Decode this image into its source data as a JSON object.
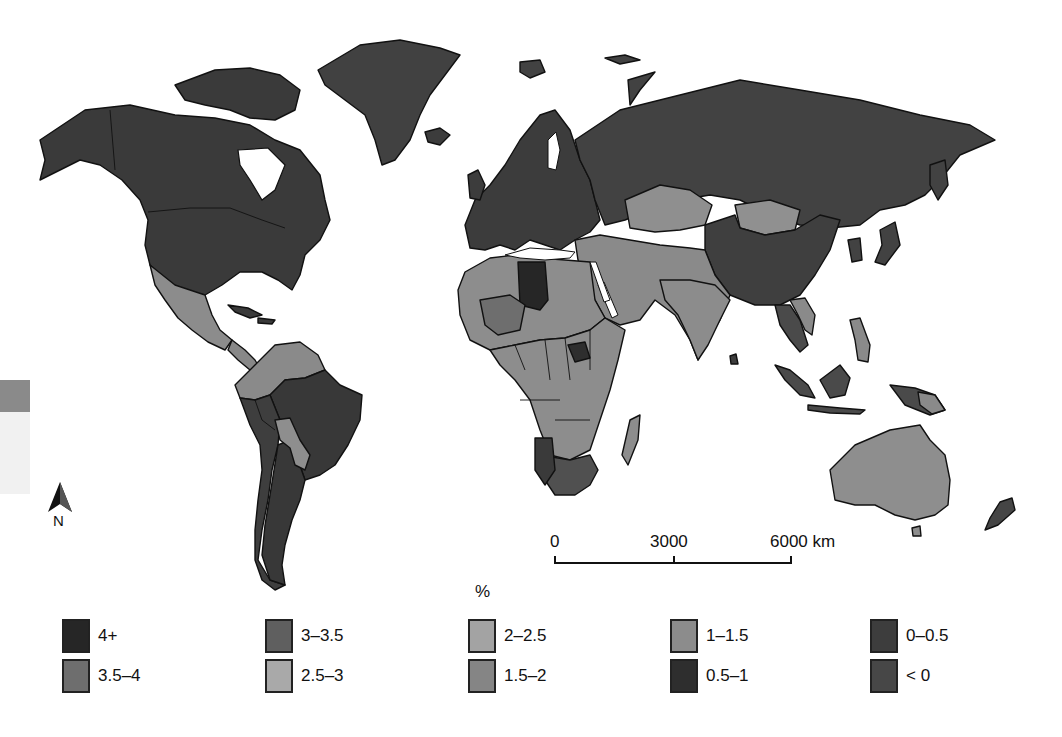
{
  "map": {
    "type": "choropleth",
    "subject": "world countries shaded by percentage class",
    "background": "#ffffff",
    "border_color": "#111111",
    "north_arrow": {
      "label": "N"
    },
    "scale_bar": {
      "ticks": [
        "0",
        "3000",
        "6000 km"
      ],
      "max_km": 6000
    },
    "legend": {
      "title": "%",
      "classes": [
        {
          "label": "4+",
          "color": "#262626"
        },
        {
          "label": "3.5–4",
          "color": "#6e6e6e"
        },
        {
          "label": "3–3.5",
          "color": "#5f5f5f"
        },
        {
          "label": "2.5–3",
          "color": "#a9a9a9"
        },
        {
          "label": "2–2.5",
          "color": "#a3a3a3"
        },
        {
          "label": "1.5–2",
          "color": "#858585"
        },
        {
          "label": "1–1.5",
          "color": "#8c8c8c"
        },
        {
          "label": "0.5–1",
          "color": "#2e2e2e"
        },
        {
          "label": "0–0.5",
          "color": "#3d3d3d"
        },
        {
          "label": "< 0",
          "color": "#474747"
        }
      ]
    },
    "regions": [
      {
        "name": "North America (Canada, USA)",
        "shade": "#3a3a3a"
      },
      {
        "name": "Greenland",
        "shade": "#414141"
      },
      {
        "name": "Mexico & Central America",
        "shade": "#8c8c8c"
      },
      {
        "name": "South America north (Colombia, Venezuela)",
        "shade": "#8a8a8a"
      },
      {
        "name": "Brazil / Southern Cone",
        "shade": "#383838"
      },
      {
        "name": "Bolivia / Paraguay",
        "shade": "#8e8e8e"
      },
      {
        "name": "Europe",
        "shade": "#3c3c3c"
      },
      {
        "name": "Russia",
        "shade": "#424242"
      },
      {
        "name": "Central Asia (Kazakhstan)",
        "shade": "#8f8f8f"
      },
      {
        "name": "Mongolia",
        "shade": "#909090"
      },
      {
        "name": "China",
        "shade": "#3f3f3f"
      },
      {
        "name": "Middle East & South Asia",
        "shade": "#8a8a8a"
      },
      {
        "name": "North Africa (Libya)",
        "shade": "#262626"
      },
      {
        "name": "Sub-Saharan Africa",
        "shade": "#8d8d8d"
      },
      {
        "name": "Southern Africa",
        "shade": "#505050"
      },
      {
        "name": "Southeast Asia / Indonesia",
        "shade": "#4a4a4a"
      },
      {
        "name": "Australia",
        "shade": "#8e8e8e"
      },
      {
        "name": "New Zealand",
        "shade": "#454545"
      }
    ]
  }
}
